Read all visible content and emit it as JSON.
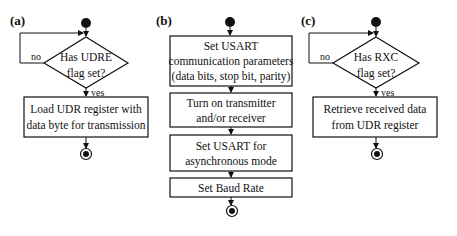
{
  "panels": [
    {
      "id": "a",
      "label": "(a)",
      "decision": {
        "line1": "Has UDRE",
        "line2": "flag set?"
      },
      "no_label": "no",
      "yes_label": "yes",
      "action": {
        "line1": "Load UDR register with",
        "line2": "data byte for transmission"
      }
    },
    {
      "id": "b",
      "label": "(b)",
      "steps": [
        {
          "lines": [
            "Set USART",
            "communication parameters",
            "(data bits, stop bit, parity)"
          ]
        },
        {
          "lines": [
            "Turn on transmitter",
            "and/or receiver"
          ]
        },
        {
          "lines": [
            "Set USART for",
            "asynchronous mode"
          ]
        },
        {
          "lines": [
            "Set Baud Rate"
          ]
        }
      ]
    },
    {
      "id": "c",
      "label": "(c)",
      "decision": {
        "line1": "Has RXC",
        "line2": "flag set?"
      },
      "no_label": "no",
      "yes_label": "yes",
      "action": {
        "line1": "Retrieve received data",
        "line2": "from UDR register"
      }
    }
  ],
  "colors": {
    "stroke": "#111111",
    "background": "#ffffff"
  }
}
